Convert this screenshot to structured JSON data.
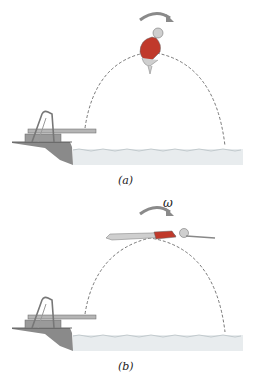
{
  "figure": {
    "panels": [
      {
        "id": "a",
        "label": "(a)",
        "pose": "tucked",
        "rotation_symbol": ""
      },
      {
        "id": "b",
        "label": "(b)",
        "pose": "layout",
        "rotation_symbol": "ω"
      }
    ]
  },
  "colors": {
    "arrow": "#8a8a8a",
    "board": "#a9a9a9",
    "water": "#e6eaec",
    "suit": "#c0392b",
    "skin": "#c8c8c8",
    "ground": "#777777"
  }
}
